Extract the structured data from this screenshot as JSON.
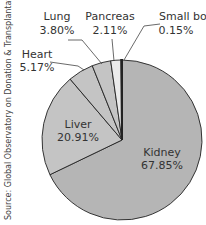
{
  "chart_data": {
    "type": "pie",
    "title": "",
    "categories": [
      "Kidney",
      "Liver",
      "Heart",
      "Lung",
      "Pancreas",
      "Small bowel"
    ],
    "values": [
      67.85,
      20.91,
      5.17,
      3.8,
      2.11,
      0.15
    ],
    "value_labels": [
      "67.85%",
      "20.91%",
      "5.17%",
      "3.80%",
      "2.11%",
      "0.15%"
    ],
    "colors": [
      "#b5b5b5",
      "#c4c4c4",
      "#c4c4c4",
      "#c4c4c4",
      "#ebebeb",
      "#111111"
    ],
    "source": "Source: Global Observatory on Donation & Transplantation",
    "legend": "none (direct labels)"
  },
  "labels": {
    "kidney": {
      "name": "Kidney",
      "pct": "67.85%"
    },
    "liver": {
      "name": "Liver",
      "pct": "20.91%"
    },
    "heart": {
      "name": "Heart",
      "pct": "5.17%"
    },
    "lung": {
      "name": "Lung",
      "pct": "3.80%"
    },
    "pancreas": {
      "name": "Pancreas",
      "pct": "2.11%"
    },
    "small_bowel": {
      "name": "Small bowel",
      "pct": "0.15%"
    }
  },
  "source_text": "Source: Global Observatory on Donation & Transplantation"
}
